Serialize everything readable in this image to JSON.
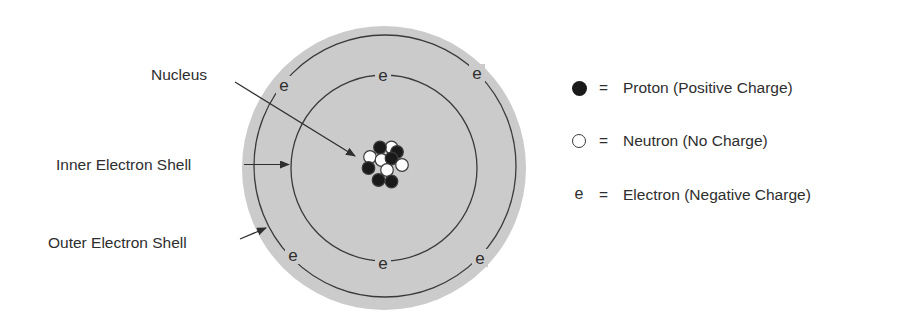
{
  "diagram": {
    "colors": {
      "atom_fill": "#cbcbcb",
      "shell_stroke": "#3a3a3a",
      "proton": "#1a1a1a",
      "neutron_fill": "#ffffff",
      "text": "#2e2e2e"
    },
    "labels": {
      "nucleus": "Nucleus",
      "inner_shell": "Inner Electron Shell",
      "outer_shell": "Outer Electron Shell"
    },
    "electron_symbol": "e",
    "inner_shell_electrons": 2,
    "outer_shell_electrons": 4,
    "nucleus": {
      "protons": 6,
      "neutrons": 5
    }
  },
  "legend": {
    "items": [
      {
        "symbol": "filled-circle",
        "equals": "=",
        "text": "Proton (Positive Charge)"
      },
      {
        "symbol": "open-circle",
        "equals": "=",
        "text": "Neutron (No Charge)"
      },
      {
        "symbol": "e",
        "equals": "=",
        "text": "Electron (Negative Charge)"
      }
    ]
  }
}
